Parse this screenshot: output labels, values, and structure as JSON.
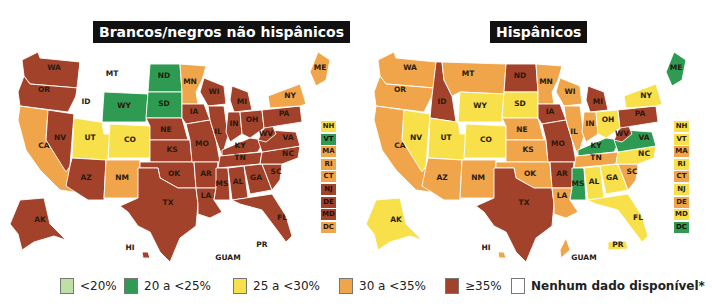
{
  "colors": {
    "lt20": "#bfe0a4",
    "20to25": "#2e9a52",
    "25to30": "#f7e04a",
    "30to35": "#f0a54a",
    "ge35": "#a2422a",
    "nodata": "#ffffff"
  },
  "maps": [
    {
      "title": "Brancos/negros não hispânicos",
      "states": {
        "WA": "ge35",
        "OR": "ge35",
        "CA": "30to35",
        "NV": "ge35",
        "ID": "nodata",
        "MT": "nodata",
        "WY": "20to25",
        "UT": "25to30",
        "CO": "25to30",
        "AZ": "ge35",
        "NM": "30to35",
        "ND": "20to25",
        "SD": "20to25",
        "NE": "ge35",
        "KS": "ge35",
        "OK": "ge35",
        "TX": "ge35",
        "MN": "30to35",
        "IA": "ge35",
        "MO": "ge35",
        "AR": "ge35",
        "LA": "ge35",
        "WI": "ge35",
        "IL": "ge35",
        "MI": "ge35",
        "IN": "ge35",
        "OH": "ge35",
        "KY": "ge35",
        "TN": "ge35",
        "MS": "ge35",
        "AL": "ge35",
        "GA": "ge35",
        "FL": "ge35",
        "SC": "ge35",
        "NC": "ge35",
        "VA": "ge35",
        "WV": "ge35",
        "PA": "ge35",
        "NY": "30to35",
        "ME": "30to35",
        "AK": "ge35",
        "HI": "ge35",
        "GUAM": "nodata",
        "PR": "nodata"
      },
      "sidebar": [
        {
          "label": "NH",
          "cat": "25to30"
        },
        {
          "label": "VT",
          "cat": "20to25"
        },
        {
          "label": "MA",
          "cat": "30to35"
        },
        {
          "label": "RI",
          "cat": "30to35"
        },
        {
          "label": "CT",
          "cat": "30to35"
        },
        {
          "label": "NJ",
          "cat": "ge35"
        },
        {
          "label": "DE",
          "cat": "ge35"
        },
        {
          "label": "MD",
          "cat": "ge35"
        },
        {
          "label": "DC",
          "cat": "30to35"
        }
      ]
    },
    {
      "title": "Hispânicos",
      "states": {
        "WA": "30to35",
        "OR": "30to35",
        "CA": "30to35",
        "NV": "25to30",
        "ID": "ge35",
        "MT": "30to35",
        "WY": "25to30",
        "UT": "25to30",
        "CO": "25to30",
        "AZ": "30to35",
        "NM": "30to35",
        "ND": "ge35",
        "SD": "25to30",
        "NE": "30to35",
        "KS": "30to35",
        "OK": "30to35",
        "TX": "ge35",
        "MN": "30to35",
        "IA": "ge35",
        "MO": "ge35",
        "AR": "ge35",
        "LA": "30to35",
        "WI": "30to35",
        "IL": "30to35",
        "MI": "ge35",
        "IN": "30to35",
        "OH": "25to30",
        "KY": "20to25",
        "TN": "30to35",
        "MS": "20to25",
        "AL": "25to30",
        "GA": "25to30",
        "FL": "25to30",
        "SC": "30to35",
        "NC": "25to30",
        "VA": "20to25",
        "WV": "ge35",
        "PA": "ge35",
        "NY": "25to30",
        "ME": "20to25",
        "AK": "25to30",
        "HI": "30to35",
        "GUAM": "30to35",
        "PR": "25to30"
      },
      "sidebar": [
        {
          "label": "NH",
          "cat": "25to30"
        },
        {
          "label": "VT",
          "cat": "25to30"
        },
        {
          "label": "MA",
          "cat": "30to35"
        },
        {
          "label": "RI",
          "cat": "25to30"
        },
        {
          "label": "CT",
          "cat": "30to35"
        },
        {
          "label": "NJ",
          "cat": "25to30"
        },
        {
          "label": "DE",
          "cat": "30to35"
        },
        {
          "label": "MD",
          "cat": "25to30"
        },
        {
          "label": "DC",
          "cat": "20to25"
        }
      ]
    }
  ],
  "inset_labels": {
    "hi": "HI",
    "guam": "GUAM",
    "pr": "PR"
  },
  "legend": [
    {
      "cat": "lt20",
      "label": "<20%"
    },
    {
      "cat": "20to25",
      "label": "20 a <25%"
    },
    {
      "cat": "25to30",
      "label": "25 a <30%"
    },
    {
      "cat": "30to35",
      "label": "30 a <35%"
    },
    {
      "cat": "ge35",
      "label": "≥35%"
    },
    {
      "cat": "nodata",
      "label": "Nenhum dado disponível*"
    }
  ]
}
